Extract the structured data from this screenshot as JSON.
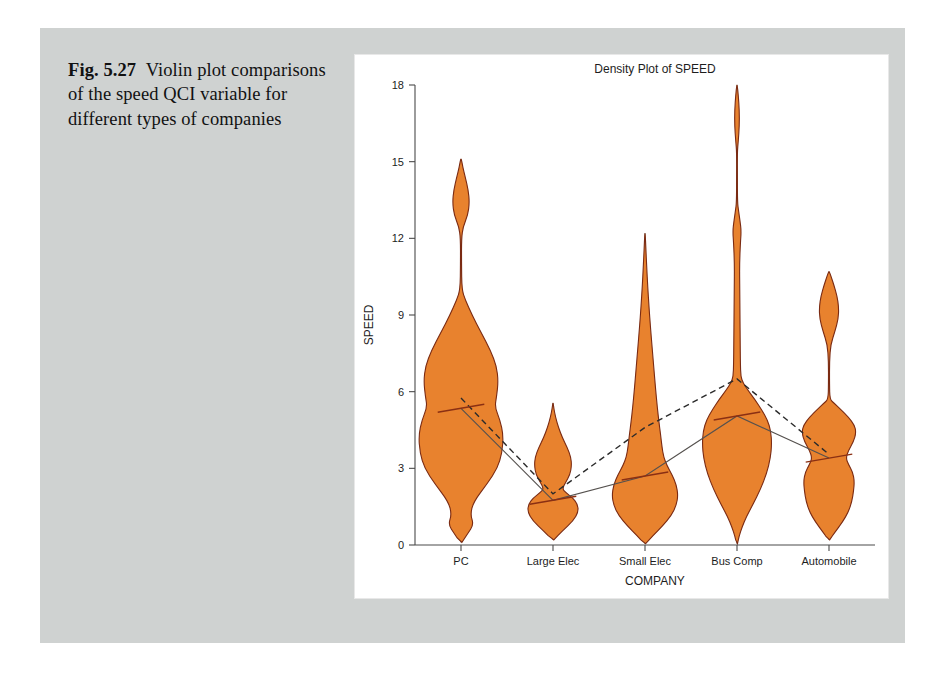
{
  "caption": {
    "figure_number": "Fig. 5.27",
    "text": "Violin plot comparisons of the speed QCI variable for different types of companies"
  },
  "chart_data": {
    "type": "violin",
    "title": "Density Plot of SPEED",
    "xlabel": "COMPANY",
    "ylabel": "SPEED",
    "ylim": [
      0,
      18
    ],
    "yticks": [
      0,
      3,
      6,
      9,
      12,
      15,
      18
    ],
    "ytick_labels": [
      "0",
      "3",
      "6",
      "9",
      "12",
      "15",
      "18"
    ],
    "categories": [
      "PC",
      "Large Elec",
      "Small Elec",
      "Bus Comp",
      "Automobile"
    ],
    "grid": false,
    "legend": "none",
    "fill_color": "#E8822E",
    "outline_color": "#7A2A12",
    "series": [
      {
        "name": "mean",
        "style": "dashed",
        "values": [
          5.75,
          2.0,
          4.6,
          6.5,
          3.55
        ]
      },
      {
        "name": "median",
        "style": "solid",
        "values": [
          5.35,
          1.75,
          2.7,
          5.05,
          3.4
        ]
      }
    ],
    "violins": [
      {
        "category": "PC",
        "min": 0.1,
        "max": 15.1,
        "upper_lobe": [
          12.4,
          15.1
        ],
        "body_range": [
          0.1,
          10.0
        ],
        "peak_value": 5.6,
        "max_width": 1.0
      },
      {
        "category": "Large Elec",
        "min": 0.2,
        "max": 5.55,
        "body_range": [
          0.2,
          5.55
        ],
        "peak_value": 1.2,
        "max_width": 0.62
      },
      {
        "category": "Small Elec",
        "min": 0.05,
        "max": 12.2,
        "body_range": [
          0.05,
          12.2
        ],
        "peak_value": 1.9,
        "max_width": 0.78
      },
      {
        "category": "Bus Comp",
        "min": 0.05,
        "max": 18.0,
        "upper_lobe": [
          15.6,
          18.0
        ],
        "body_range": [
          0.05,
          13.4
        ],
        "peak_value": 4.6,
        "max_width": 0.82
      },
      {
        "category": "Automobile",
        "min": 0.2,
        "max": 10.7,
        "upper_lobe": [
          7.8,
          10.7
        ],
        "body_range": [
          0.2,
          5.7
        ],
        "peak_value": 2.6,
        "max_width": 0.72
      }
    ]
  }
}
